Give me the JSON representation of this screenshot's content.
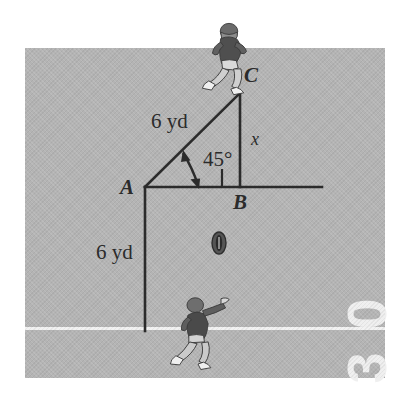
{
  "figure": {
    "background_color": "#ffffff",
    "field_color": "#b4b4b4",
    "line_color": "#2b2b2b",
    "yardline_color": "#f2f2f2"
  },
  "field": {
    "yard_marker_top_digit": "0",
    "yard_marker_bottom_digit": "3",
    "yard_marker_reading": "30"
  },
  "triangle": {
    "vertex_a_label": "A",
    "vertex_b_label": "B",
    "vertex_c_label": "C",
    "hypotenuse_label": "6 yd",
    "vertical_leg_label": "6 yd",
    "unknown_side_label": "x",
    "angle_label": "45°",
    "right_angle_at": "B"
  },
  "objects": {
    "receiver_icon": "football-player-running",
    "quarterback_icon": "football-player-throwing",
    "ball_icon": "football"
  }
}
